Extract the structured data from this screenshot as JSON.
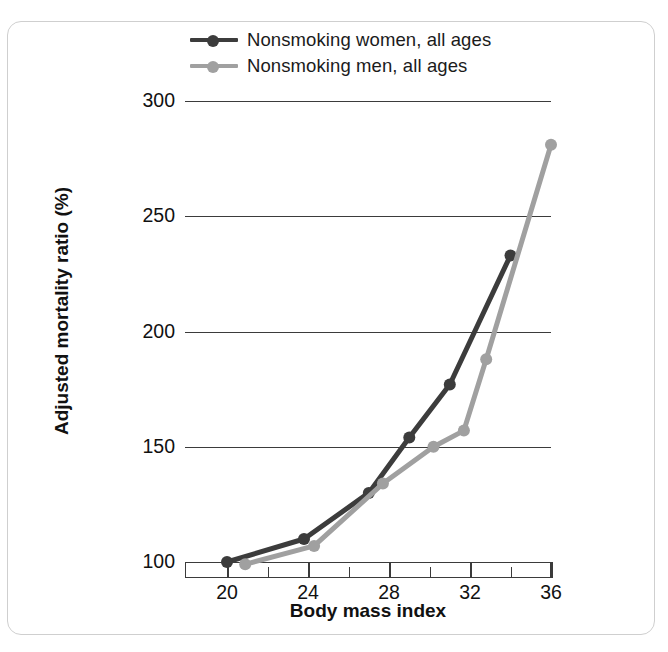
{
  "legend": {
    "position": "top-center",
    "items": [
      {
        "label": "Nonsmoking women, all ages",
        "color": "#3c3c3c",
        "name": "legend-women"
      },
      {
        "label": "Nonsmoking men, all ages",
        "color": "#a0a0a0",
        "name": "legend-men"
      }
    ]
  },
  "chart_data": {
    "type": "line",
    "title": "",
    "xlabel": "Body mass index",
    "ylabel": "Adjusted mortality ratio (%)",
    "xlim": [
      18,
      36
    ],
    "ylim": [
      100,
      300
    ],
    "xticks": [
      20,
      24,
      28,
      32,
      36
    ],
    "xtick_labels": [
      "20",
      "24",
      "28",
      "32",
      "36"
    ],
    "xminor_ticks": [
      22,
      26,
      30,
      34
    ],
    "yticks": [
      100,
      150,
      200,
      250,
      300
    ],
    "ytick_labels": [
      "100",
      "150",
      "200",
      "250",
      "300"
    ],
    "grid": "horizontal",
    "legend_position": "top-center",
    "series": [
      {
        "name": "Nonsmoking women, all ages",
        "color": "#3c3c3c",
        "x": [
          20.0,
          23.8,
          27.0,
          29.0,
          31.0,
          34.0
        ],
        "y": [
          100,
          110,
          130,
          154,
          177,
          233
        ]
      },
      {
        "name": "Nonsmoking men, all ages",
        "color": "#a0a0a0",
        "x": [
          20.9,
          24.3,
          27.7,
          30.2,
          31.7,
          32.8,
          36.0
        ],
        "y": [
          99,
          107,
          134,
          150,
          157,
          188,
          281
        ]
      }
    ]
  }
}
